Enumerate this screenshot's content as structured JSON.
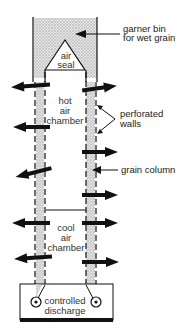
{
  "diagram": {
    "type": "continuous-flow grain dryer cross-section",
    "colors": {
      "background": "#ffffff",
      "line": "#111111",
      "grain_fill": "#cfcfcf",
      "arrow": "#111111",
      "text": "#222222"
    },
    "labels": {
      "garner_line1": "garner bin",
      "garner_line2": "for wet grain",
      "air_seal_line1": "air",
      "air_seal_line2": "seal",
      "hot_line1": "hot",
      "hot_line2": "air",
      "hot_line3": "chamber",
      "perforated_line1": "perforated",
      "perforated_line2": "walls",
      "grain_column": "grain column",
      "cool_line1": "cool",
      "cool_line2": "air",
      "cool_line3": "chamber",
      "discharge_line1": "controlled",
      "discharge_line2": "discharge"
    },
    "icons": {
      "airflow_arrow": "arrow-icon",
      "discharge_roller": "roller-icon"
    }
  }
}
